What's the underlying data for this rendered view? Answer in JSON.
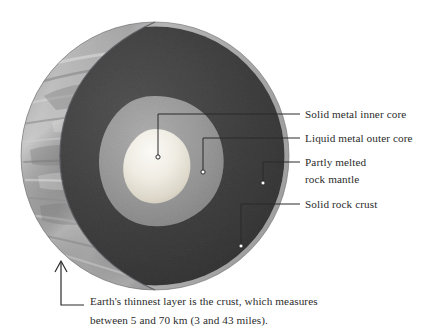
{
  "figure": {
    "colors": {
      "background": "#ffffff",
      "surface_crescent_light": "#b9b9b9",
      "surface_crescent_dark": "#8d8d8d",
      "mantle_dark": "#3d3d3d",
      "mantle_mid": "#4a4a4a",
      "outer_core": "#9a9a9a",
      "inner_core_light": "#f2f0ea",
      "inner_core_shadow": "#cfcabd",
      "crust_rim": "#a8a8a8",
      "leader_line": "#2b2b2b",
      "text": "#2b2b2b"
    },
    "sphere": {
      "center_x": 155,
      "center_y": 156,
      "radius": 134
    }
  },
  "labels": [
    {
      "id": "inner-core",
      "text": "Solid metal inner core",
      "marker_x": 158,
      "marker_y": 157
    },
    {
      "id": "outer-core",
      "text": "Liquid metal outer core",
      "marker_x": 203,
      "marker_y": 172
    },
    {
      "id": "mantle",
      "line1": "Partly melted",
      "line2": "rock mantle",
      "marker_x": 263,
      "marker_y": 183
    },
    {
      "id": "crust",
      "text": "Solid rock crust",
      "marker_x": 241,
      "marker_y": 246
    }
  ],
  "caption": {
    "line1": "Earth's thinnest layer is the crust, which measures",
    "line2": "between 5 and 70 km (3 and 43 miles).",
    "arrow_points_to": "crust"
  }
}
